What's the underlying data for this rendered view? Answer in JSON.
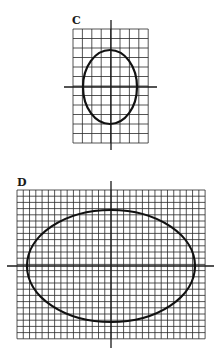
{
  "colors": {
    "grid": "#2a2a2a",
    "axis": "#1a1a1a",
    "ellipse": "#111111",
    "background": "#ffffff"
  },
  "panels": [
    {
      "label": "C",
      "label_pos": [
        72,
        15
      ],
      "grid": {
        "x": 73,
        "y": 29,
        "cols": 8,
        "rows": 12,
        "cell_w": 9.4,
        "cell_h": 9.5
      },
      "axes": {
        "cx": 111,
        "cy": 87,
        "h_from": 64,
        "h_to": 157,
        "v_from": 20,
        "v_to": 150
      },
      "ellipse": {
        "cx": 110,
        "cy": 87,
        "rx": 27,
        "ry": 37,
        "stroke_width": 2.2
      }
    },
    {
      "label": "D",
      "label_pos": [
        17,
        177
      ],
      "grid": {
        "x": 17,
        "y": 190,
        "cols": 30,
        "rows": 24,
        "cell_w": 6.27,
        "cell_h": 6.2
      },
      "axes": {
        "cx": 111,
        "cy": 266,
        "h_from": 7,
        "h_to": 214,
        "v_from": 181,
        "v_to": 348
      },
      "ellipse": {
        "cx": 111,
        "cy": 266,
        "rx": 84,
        "ry": 56,
        "stroke_width": 2.2
      }
    }
  ]
}
